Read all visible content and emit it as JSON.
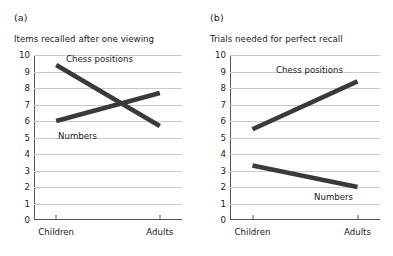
{
  "figure": {
    "background": "#ffffff",
    "line_color": "#3a3a3a",
    "grid_color": "#c9c9c9",
    "axis_color": "#555555"
  },
  "panels": [
    {
      "letter": "(a)",
      "title": "Items recalled after one viewing"
    },
    {
      "letter": "(b)",
      "title": "Trials needed for perfect recall"
    }
  ],
  "labels": {
    "chess_positions": "Chess positions",
    "numbers": "Numbers",
    "children": "Children",
    "adults": "Adults"
  },
  "chart_data": [
    {
      "type": "line",
      "title": "Items recalled after one viewing",
      "panel": "(a)",
      "xlabel": "",
      "ylabel": "",
      "categories": [
        "Children",
        "Adults"
      ],
      "x": [
        "Children",
        "Adults"
      ],
      "ylim": [
        0,
        10
      ],
      "yticks": [
        0,
        1,
        2,
        3,
        4,
        5,
        6,
        7,
        8,
        9,
        10
      ],
      "ytick_labels": [
        "0",
        "1",
        "2",
        "3",
        "4",
        "5",
        "6",
        "7",
        "8",
        "9",
        "10"
      ],
      "grid": true,
      "legend": "inline-annotations",
      "series": [
        {
          "name": "Chess positions",
          "values": [
            9.4,
            5.7
          ],
          "annotation_at": "Children"
        },
        {
          "name": "Numbers",
          "values": [
            6.0,
            7.7
          ],
          "annotation_at": "Children"
        }
      ]
    },
    {
      "type": "line",
      "title": "Trials needed for perfect recall",
      "panel": "(b)",
      "xlabel": "",
      "ylabel": "",
      "categories": [
        "Children",
        "Adults"
      ],
      "x": [
        "Children",
        "Adults"
      ],
      "ylim": [
        0,
        10
      ],
      "yticks": [
        0,
        1,
        2,
        3,
        4,
        5,
        6,
        7,
        8,
        9,
        10
      ],
      "ytick_labels": [
        "0",
        "1",
        "2",
        "3",
        "4",
        "5",
        "6",
        "7",
        "8",
        "9",
        "10"
      ],
      "grid": true,
      "legend": "inline-annotations",
      "series": [
        {
          "name": "Chess positions",
          "values": [
            5.5,
            8.4
          ],
          "annotation_at": "middle-top"
        },
        {
          "name": "Numbers",
          "values": [
            3.3,
            2.0
          ],
          "annotation_at": "Adults"
        }
      ]
    }
  ]
}
